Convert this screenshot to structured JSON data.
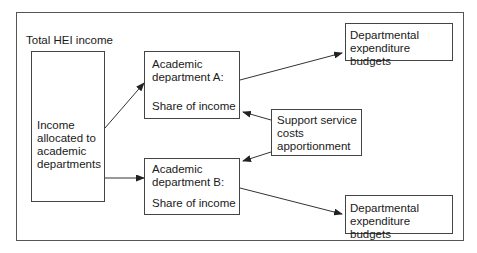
{
  "diagram": {
    "title_label": "Total HEI income",
    "income_box": {
      "lines": [
        "Income",
        "allocated to",
        "academic",
        "departments"
      ]
    },
    "dept_a": {
      "line1": "Academic",
      "line2": "department A:",
      "share": "Share of income"
    },
    "dept_b": {
      "line1": "Academic",
      "line2": "department B:",
      "share": "Share of income"
    },
    "support": {
      "lines": [
        "Support service",
        "costs",
        "apportionment"
      ]
    },
    "budget_top": {
      "lines": [
        "Departmental",
        "expenditure budgets"
      ]
    },
    "budget_bottom": {
      "lines": [
        "Departmental",
        "expenditure budgets"
      ]
    },
    "edges": [
      {
        "from": "income_box",
        "to": "dept_a"
      },
      {
        "from": "income_box",
        "to": "dept_b"
      },
      {
        "from": "dept_a",
        "to": "budget_top"
      },
      {
        "from": "dept_b",
        "to": "budget_bottom"
      },
      {
        "from": "support",
        "to": "dept_a"
      },
      {
        "from": "support",
        "to": "dept_b"
      }
    ]
  }
}
